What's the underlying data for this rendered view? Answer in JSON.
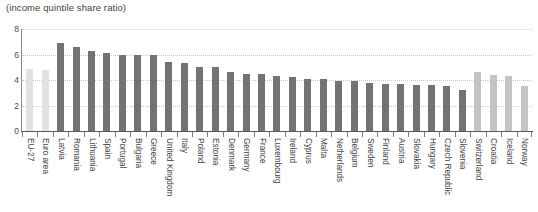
{
  "subtitle": "(income quintile share ratio)",
  "colors": {
    "bar_aggregate": "#e2e2e2",
    "bar_member": "#737373",
    "bar_nonmember": "#c4c4c4",
    "gridline": "#c9c9c9",
    "axis": "#5a5a5a",
    "text": "#3f3f3f"
  },
  "chart_data": {
    "type": "bar",
    "title": "",
    "subtitle": "(income quintile share ratio)",
    "xlabel": "",
    "ylabel": "",
    "ylim": [
      0,
      8
    ],
    "yticks": [
      0,
      2,
      4,
      6,
      8
    ],
    "grid": true,
    "legend": "none",
    "categories": [
      "EU-27",
      "Euro area",
      "Latvia",
      "Romania",
      "Lithuania",
      "Spain",
      "Portugal",
      "Bulgaria",
      "Greece",
      "United Kingdom",
      "Italy",
      "Poland",
      "Estonia",
      "Denmark",
      "Germany",
      "France",
      "Luxembourg",
      "Ireland",
      "Cyprus",
      "Malta",
      "Netherlands",
      "Belgium",
      "Sweden",
      "Finland",
      "Austria",
      "Slovakia",
      "Hungary",
      "Czech Republic",
      "Slovenia",
      "Switzerland",
      "Croatia",
      "Iceland",
      "Norway"
    ],
    "values": [
      4.9,
      4.8,
      6.9,
      6.6,
      6.3,
      6.1,
      6.0,
      6.0,
      6.0,
      5.4,
      5.3,
      5.0,
      5.0,
      4.6,
      4.5,
      4.5,
      4.3,
      4.2,
      4.1,
      4.1,
      3.9,
      3.9,
      3.8,
      3.7,
      3.7,
      3.6,
      3.6,
      3.5,
      3.2,
      4.6,
      4.4,
      4.3,
      3.5
    ],
    "groups": [
      "aggregate",
      "aggregate",
      "member",
      "member",
      "member",
      "member",
      "member",
      "member",
      "member",
      "member",
      "member",
      "member",
      "member",
      "member",
      "member",
      "member",
      "member",
      "member",
      "member",
      "member",
      "member",
      "member",
      "member",
      "member",
      "member",
      "member",
      "member",
      "member",
      "member",
      "nonmember",
      "nonmember",
      "nonmember",
      "nonmember"
    ]
  }
}
